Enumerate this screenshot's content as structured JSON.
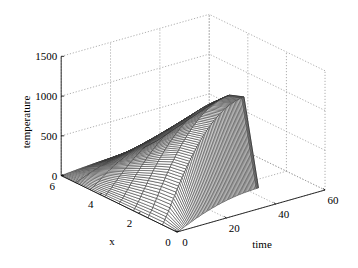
{
  "chart_data": {
    "type": "surface",
    "title": "",
    "xlabel": "x",
    "ylabel": "time",
    "zlabel": "temperature",
    "x_ticks": [
      0,
      2,
      4,
      6
    ],
    "time_ticks": [
      0,
      20,
      40,
      60
    ],
    "z_ticks": [
      0,
      500,
      1000,
      1500
    ],
    "xlim": [
      0,
      6
    ],
    "time_lim": [
      0,
      60
    ],
    "zlim": [
      0,
      1500
    ],
    "grid": true,
    "x": [
      0,
      0.75,
      1.5,
      2.25,
      3,
      3.75,
      4.5,
      5.25,
      6
    ],
    "time": [
      0,
      2,
      4,
      6,
      8,
      10,
      12,
      14,
      16,
      18,
      20,
      22,
      24,
      26,
      28,
      30,
      32,
      33
    ],
    "peak_temperature_by_time": [
      0,
      120,
      260,
      400,
      530,
      650,
      760,
      860,
      950,
      1030,
      1100,
      1160,
      1210,
      1250,
      1280,
      1300,
      1315,
      1320
    ],
    "x_profile": [
      0.2,
      1.0,
      0.95,
      0.82,
      0.66,
      0.5,
      0.34,
      0.18,
      0.04
    ],
    "note": "Temperature surface T(x,time) estimated as peak_temperature_by_time[t] * x_profile[x]"
  },
  "colors": {
    "mesh": "#333333",
    "surface": "#ffffff",
    "grid": "#9a9a9a",
    "axis": "#000000"
  }
}
